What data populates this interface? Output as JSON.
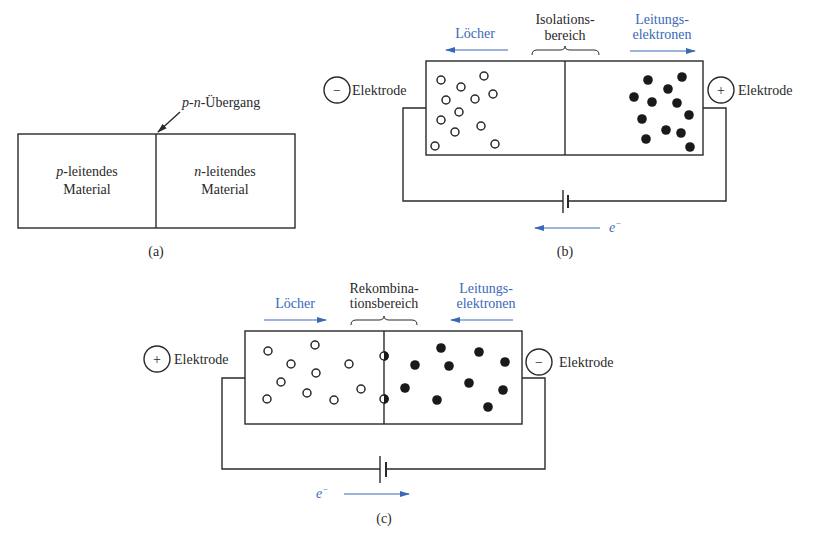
{
  "panel_a": {
    "junction_label_p": "p",
    "junction_label_dash1": "-",
    "junction_label_n": "n",
    "junction_label_rest": "-Übergang",
    "left_region_line1_italic": "p",
    "left_region_line1_rest": "-leitendes",
    "left_region_line2": "Material",
    "right_region_line1_italic": "n",
    "right_region_line1_rest": "-leitendes",
    "right_region_line2": "Material",
    "caption": "(a)"
  },
  "panel_b": {
    "holes_label": "Löcher",
    "region_label_line1": "Isolations-",
    "region_label_line2": "bereich",
    "electrons_label_line1": "Leitungs-",
    "electrons_label_line2": "elektronen",
    "left_electrode_sign": "−",
    "left_electrode_label": "Elektrode",
    "right_electrode_sign": "+",
    "right_electrode_label": "Elektrode",
    "electron_flow_label": "e",
    "electron_flow_sup": "−",
    "caption": "(b)"
  },
  "panel_c": {
    "holes_label": "Löcher",
    "region_label_line1": "Rekombina-",
    "region_label_line2": "tionsbereich",
    "electrons_label_line1": "Leitungs-",
    "electrons_label_line2": "elektronen",
    "left_electrode_sign": "+",
    "left_electrode_label": "Elektrode",
    "right_electrode_sign": "−",
    "right_electrode_label": "Elektrode",
    "electron_flow_label": "e",
    "electron_flow_sup": "−",
    "caption": "(c)"
  },
  "colors": {
    "accent_blue": "#3a68b8",
    "ink": "#2a2a2a"
  }
}
